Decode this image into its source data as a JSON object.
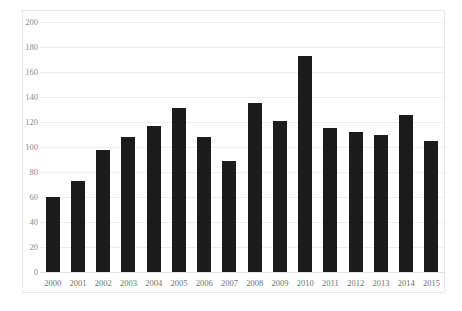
{
  "chart_data": {
    "type": "bar",
    "title": "",
    "subtitle": "",
    "xlabel": "",
    "ylabel": "",
    "categories": [
      "2000",
      "2001",
      "2002",
      "2003",
      "2004",
      "2005",
      "2006",
      "2007",
      "2008",
      "2009",
      "2010",
      "2011",
      "2012",
      "2013",
      "2014",
      "2015"
    ],
    "values": [
      60,
      73,
      98,
      108,
      117,
      131,
      108,
      89,
      135,
      121,
      173,
      115,
      112,
      110,
      126,
      105
    ],
    "ylim": [
      0,
      200
    ],
    "ytick_values": [
      0,
      20,
      40,
      60,
      80,
      100,
      120,
      140,
      160,
      180,
      200
    ],
    "ytick_labels": [
      "0",
      "20",
      "40",
      "60",
      "80",
      "100",
      "120",
      "140",
      "160",
      "180",
      "200"
    ],
    "grid": true,
    "grid_axis": "y",
    "legend": false,
    "legend_position": "none",
    "annotations": [],
    "bar_color": "#1c1c1c",
    "gridline_color": "#ededed",
    "axis_label_color": "#8a8a8a",
    "background_color": "#ffffff",
    "border_color": "#e9e9e9"
  }
}
